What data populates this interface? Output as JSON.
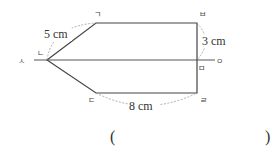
{
  "diagram": {
    "type": "geometry-figure",
    "vertices": {
      "giyeok": {
        "label": "ㄱ",
        "x": 96,
        "y": 23
      },
      "nieun": {
        "label": "ㄴ",
        "x": 47,
        "y": 60
      },
      "digeut": {
        "label": "ㄷ",
        "x": 96,
        "y": 93
      },
      "rieul": {
        "label": "ㄹ",
        "x": 197,
        "y": 93
      },
      "mieum": {
        "label": "ㅁ",
        "x": 197,
        "y": 60
      },
      "bieup": {
        "label": "ㅂ",
        "x": 197,
        "y": 23
      }
    },
    "line_endpoints": {
      "siot": {
        "label": "ㅅ"
      },
      "ieung": {
        "label": "ㅇ"
      }
    },
    "measurements": {
      "gn": "5 cm",
      "bm": "3 cm",
      "dr": "8 cm"
    },
    "answer_blank": {
      "open": "(",
      "close": ")"
    },
    "colors": {
      "stroke": "#444444",
      "dashed": "#9a9a9a",
      "text": "#333333"
    }
  }
}
